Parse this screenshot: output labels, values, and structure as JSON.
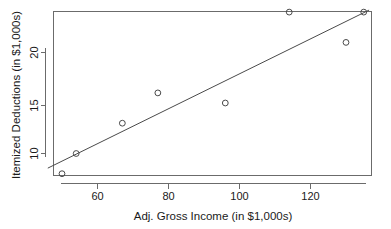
{
  "chart_data": {
    "type": "scatter",
    "title": "",
    "xlabel": "Adj. Gross Income (in $1,000s)",
    "ylabel": "Itemized Deductions (in $1,000s)",
    "xlim": [
      46,
      137
    ],
    "ylim": [
      7.2,
      24.6
    ],
    "grid": false,
    "legend": "none",
    "xticks": [
      60,
      80,
      100,
      120
    ],
    "xtick_labels": [
      "60",
      "80",
      "100",
      "120"
    ],
    "yticks": [
      10,
      15,
      20
    ],
    "ytick_labels": [
      "10",
      "15",
      "20"
    ],
    "x": [
      50,
      54,
      67,
      77,
      96,
      114,
      130,
      135
    ],
    "y": [
      8,
      10,
      13,
      16,
      15,
      24,
      21,
      24
    ],
    "points": [
      {
        "x": 50,
        "y": 8
      },
      {
        "x": 54,
        "y": 10
      },
      {
        "x": 67,
        "y": 13
      },
      {
        "x": 77,
        "y": 16
      },
      {
        "x": 96,
        "y": 15
      },
      {
        "x": 114,
        "y": 24
      },
      {
        "x": 130,
        "y": 21
      },
      {
        "x": 135,
        "y": 24
      }
    ],
    "series": [
      {
        "name": "observations",
        "marker": "open-circle",
        "color": "#4a4a4a",
        "values": [
          8,
          10,
          13,
          16,
          15,
          24,
          21,
          24
        ]
      },
      {
        "name": "regression-line",
        "type": "line",
        "color": "#4a4a4a",
        "endpoints": [
          {
            "x": 46,
            "y": 8.55
          },
          {
            "x": 136.5,
            "y": 24.2
          }
        ]
      }
    ],
    "annotations": []
  },
  "axes": {
    "x_axis_label": "Adj. Gross Income (in $1,000s)",
    "y_axis_label": "Itemized Deductions (in $1,000s)"
  }
}
